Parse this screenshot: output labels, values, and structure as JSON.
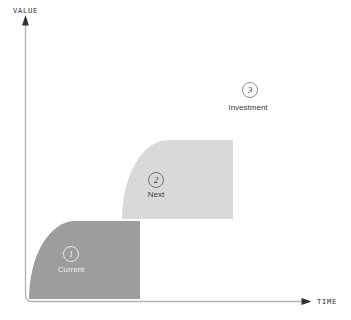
{
  "figure": {
    "kind": "growth-curves-staircase-diagram",
    "background": "#ffffff"
  },
  "axes": {
    "y_label": "VALUE",
    "x_label": "TIME",
    "line_color": "#b3b3b3",
    "arrow_color": "#303030",
    "label_color": "#2e2e2e"
  },
  "stages": [
    {
      "number": "1",
      "label": "Current",
      "fill": "#9d9d9d",
      "text_color": "#ededed",
      "has_curve": true
    },
    {
      "number": "2",
      "label": "Next",
      "fill": "#d9d9d9",
      "text_color": "#3c3c3c",
      "has_curve": true
    },
    {
      "number": "3",
      "label": "Investment",
      "fill": "none",
      "text_color": "#3c3c3c",
      "has_curve": false
    }
  ]
}
